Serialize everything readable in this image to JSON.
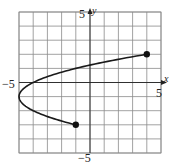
{
  "chart_data": {
    "type": "line",
    "title": "",
    "xlabel": "x",
    "ylabel": "y",
    "xlim": [
      -5,
      5
    ],
    "ylim": [
      -5,
      5
    ],
    "grid": true,
    "tick_labels": {
      "x_min": "−5",
      "x_max": "5",
      "y_max": "5",
      "y_min": "−5"
    },
    "series": [
      {
        "name": "x = (y+1)^2 - 5",
        "equation": "x = (y + 1)^2 - 5",
        "y_range": [
          -3,
          2
        ],
        "points": [
          {
            "x": -1,
            "y": -3
          },
          {
            "x": -4,
            "y": -2
          },
          {
            "x": -5,
            "y": -1
          },
          {
            "x": -4,
            "y": 0
          },
          {
            "x": -1,
            "y": 1
          },
          {
            "x": 4,
            "y": 2
          }
        ],
        "endpoints": [
          {
            "x": -1,
            "y": -3,
            "style": "closed"
          },
          {
            "x": 4,
            "y": 2,
            "style": "closed"
          }
        ]
      }
    ]
  }
}
